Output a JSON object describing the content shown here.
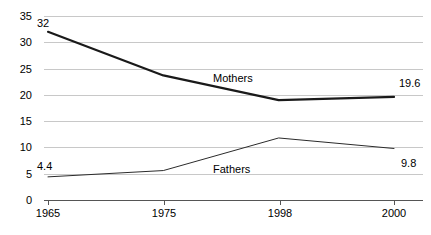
{
  "chart_data": {
    "type": "line",
    "title": "",
    "subtitle": "",
    "xlabel": "",
    "ylabel": "",
    "categories": [
      "1965",
      "1975",
      "1998",
      "2000"
    ],
    "ylim": [
      0,
      35
    ],
    "ytick_labels": [
      "0",
      "5",
      "10",
      "15",
      "20",
      "25",
      "30",
      "35"
    ],
    "ytick_values": [
      0,
      5,
      10,
      15,
      20,
      25,
      30,
      35
    ],
    "grid": true,
    "legend_position": "inline",
    "series": [
      {
        "name": "Mothers",
        "values": [
          32,
          23.7,
          19.0,
          19.6
        ],
        "color": "#1a1a1a",
        "width": 2.2
      },
      {
        "name": "Fathers",
        "values": [
          4.4,
          5.6,
          11.8,
          9.8
        ],
        "color": "#2b2b2b",
        "width": 1.0
      }
    ],
    "annotations": [
      {
        "text": "32",
        "series": "Mothers",
        "category": "1965"
      },
      {
        "text": "19.6",
        "series": "Mothers",
        "category": "2000"
      },
      {
        "text": "4.4",
        "series": "Fathers",
        "category": "1965"
      },
      {
        "text": "9.8",
        "series": "Fathers",
        "category": "2000"
      }
    ],
    "inline_labels": [
      {
        "text": "Mothers"
      },
      {
        "text": "Fathers"
      }
    ]
  },
  "colors": {
    "gridline": "#c8c8c8",
    "axis": "#555555",
    "text": "#000000",
    "background": "#ffffff"
  }
}
